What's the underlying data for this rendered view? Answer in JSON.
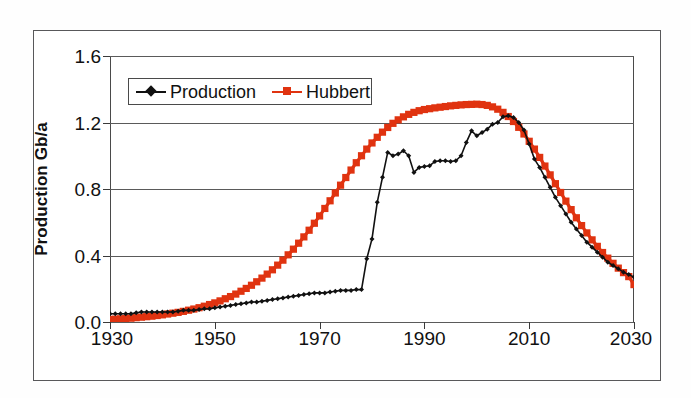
{
  "chart_data": {
    "type": "line",
    "title": "",
    "xlabel": "",
    "ylabel": "Production Gb/a",
    "xlim": [
      1930,
      2030
    ],
    "ylim": [
      0.0,
      1.6
    ],
    "xticks": [
      "1930",
      "1950",
      "1970",
      "1990",
      "2010",
      "2030"
    ],
    "xtick_values": [
      1930,
      1950,
      1970,
      1990,
      2010,
      2030
    ],
    "yticks": [
      "0.0",
      "0.4",
      "0.8",
      "1.2",
      "1.6"
    ],
    "ytick_values": [
      0.0,
      0.4,
      0.8,
      1.2,
      1.6
    ],
    "grid": "horizontal",
    "legend_position": "upper-left-inside",
    "series": [
      {
        "name": "Production",
        "color": "#111111",
        "marker": "diamond",
        "x": [
          1930,
          1931,
          1932,
          1933,
          1934,
          1935,
          1936,
          1937,
          1938,
          1939,
          1940,
          1941,
          1942,
          1943,
          1944,
          1945,
          1946,
          1947,
          1948,
          1949,
          1950,
          1951,
          1952,
          1953,
          1954,
          1955,
          1956,
          1957,
          1958,
          1959,
          1960,
          1961,
          1962,
          1963,
          1964,
          1965,
          1966,
          1967,
          1968,
          1969,
          1970,
          1971,
          1972,
          1973,
          1974,
          1975,
          1976,
          1977,
          1978,
          1979,
          1980,
          1981,
          1982,
          1983,
          1984,
          1985,
          1986,
          1987,
          1988,
          1989,
          1990,
          1991,
          1992,
          1993,
          1994,
          1995,
          1996,
          1997,
          1998,
          1999,
          2000,
          2001,
          2002,
          2003,
          2004,
          2005,
          2006,
          2007,
          2008,
          2009,
          2010,
          2011,
          2012,
          2013,
          2014,
          2015,
          2016,
          2017,
          2018,
          2019,
          2020,
          2021,
          2022,
          2023,
          2024,
          2025,
          2026,
          2027,
          2028,
          2029,
          2030
        ],
        "values": [
          0.05,
          0.05,
          0.05,
          0.05,
          0.05,
          0.055,
          0.06,
          0.06,
          0.06,
          0.06,
          0.06,
          0.06,
          0.06,
          0.065,
          0.07,
          0.07,
          0.07,
          0.075,
          0.08,
          0.08,
          0.085,
          0.09,
          0.095,
          0.1,
          0.105,
          0.11,
          0.115,
          0.12,
          0.12,
          0.125,
          0.13,
          0.135,
          0.14,
          0.145,
          0.15,
          0.155,
          0.16,
          0.165,
          0.17,
          0.175,
          0.175,
          0.175,
          0.18,
          0.185,
          0.19,
          0.19,
          0.19,
          0.195,
          0.195,
          0.38,
          0.5,
          0.72,
          0.87,
          1.02,
          1.0,
          1.01,
          1.03,
          1.0,
          0.9,
          0.93,
          0.935,
          0.94,
          0.965,
          0.97,
          0.97,
          0.965,
          0.97,
          1.0,
          1.08,
          1.15,
          1.12,
          1.14,
          1.16,
          1.19,
          1.2,
          1.235,
          1.24,
          1.23,
          1.2,
          1.155,
          1.07,
          0.98,
          0.93,
          0.87,
          0.81,
          0.75,
          0.7,
          0.65,
          0.6,
          0.56,
          0.52,
          0.48,
          0.45,
          0.42,
          0.39,
          0.36,
          0.34,
          0.32,
          0.3,
          0.285,
          0.27
        ]
      },
      {
        "name": "Hubbert",
        "color": "#E03310",
        "marker": "square",
        "x": [
          1930,
          1931,
          1932,
          1933,
          1934,
          1935,
          1936,
          1937,
          1938,
          1939,
          1940,
          1941,
          1942,
          1943,
          1944,
          1945,
          1946,
          1947,
          1948,
          1949,
          1950,
          1951,
          1952,
          1953,
          1954,
          1955,
          1956,
          1957,
          1958,
          1959,
          1960,
          1961,
          1962,
          1963,
          1964,
          1965,
          1966,
          1967,
          1968,
          1969,
          1970,
          1971,
          1972,
          1973,
          1974,
          1975,
          1976,
          1977,
          1978,
          1979,
          1980,
          1981,
          1982,
          1983,
          1984,
          1985,
          1986,
          1987,
          1988,
          1989,
          1990,
          1991,
          1992,
          1993,
          1994,
          1995,
          1996,
          1997,
          1998,
          1999,
          2000,
          2001,
          2002,
          2003,
          2004,
          2005,
          2006,
          2007,
          2008,
          2009,
          2010,
          2011,
          2012,
          2013,
          2014,
          2015,
          2016,
          2017,
          2018,
          2019,
          2020,
          2021,
          2022,
          2023,
          2024,
          2025,
          2026,
          2027,
          2028,
          2029,
          2030
        ],
        "values": [
          0.015,
          0.017,
          0.019,
          0.021,
          0.023,
          0.026,
          0.029,
          0.032,
          0.035,
          0.039,
          0.043,
          0.048,
          0.053,
          0.058,
          0.064,
          0.071,
          0.078,
          0.086,
          0.095,
          0.105,
          0.115,
          0.127,
          0.14,
          0.153,
          0.168,
          0.185,
          0.202,
          0.221,
          0.242,
          0.264,
          0.288,
          0.314,
          0.342,
          0.372,
          0.404,
          0.438,
          0.474,
          0.512,
          0.552,
          0.594,
          0.638,
          0.683,
          0.729,
          0.776,
          0.823,
          0.869,
          0.914,
          0.958,
          1.0,
          1.04,
          1.077,
          1.111,
          1.142,
          1.17,
          1.195,
          1.216,
          1.234,
          1.249,
          1.261,
          1.271,
          1.278,
          1.283,
          1.288,
          1.292,
          1.296,
          1.3,
          1.303,
          1.306,
          1.308,
          1.309,
          1.31,
          1.308,
          1.303,
          1.294,
          1.28,
          1.261,
          1.236,
          1.206,
          1.171,
          1.131,
          1.087,
          1.04,
          0.99,
          0.938,
          0.885,
          0.832,
          0.779,
          0.727,
          0.676,
          0.627,
          0.58,
          0.536,
          0.494,
          0.455,
          0.418,
          0.384,
          0.353,
          0.324,
          0.297,
          0.273,
          0.225
        ]
      }
    ]
  },
  "axes": {
    "ylabel": "Production Gb/a",
    "ytick_labels": [
      "1.6",
      "1.2",
      "0.8",
      "0.4",
      "0.0"
    ],
    "xtick_labels": [
      "1930",
      "1950",
      "1970",
      "1990",
      "2010",
      "2030"
    ]
  },
  "legend": {
    "items": [
      {
        "label": "Production",
        "color": "#111111",
        "marker": "diamond-marker"
      },
      {
        "label": "Hubbert",
        "color": "#E03310",
        "marker": "square-marker"
      }
    ]
  }
}
